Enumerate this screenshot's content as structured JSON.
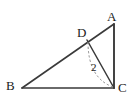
{
  "figure": {
    "background_color": "#ffffff",
    "stroke_color": "#3a3a3a",
    "dashed_stroke_color": "#8a8a8a",
    "text_color": "#1a1a1a",
    "width": 136,
    "height": 104
  },
  "points": {
    "A": {
      "label": "A",
      "x": 114,
      "y": 24,
      "label_x": 107,
      "label_y": 10
    },
    "B": {
      "label": "B",
      "x": 22,
      "y": 88,
      "label_x": 6,
      "label_y": 79
    },
    "C": {
      "label": "C",
      "x": 114,
      "y": 88,
      "label_x": 118,
      "label_y": 81
    },
    "D": {
      "label": "D",
      "x": 87,
      "y": 40,
      "label_x": 77,
      "label_y": 26
    }
  },
  "segments": [
    {
      "name": "segment-BA",
      "from": "B",
      "to": "A",
      "style": "solid"
    },
    {
      "name": "segment-BC",
      "from": "B",
      "to": "C",
      "style": "solid"
    },
    {
      "name": "segment-AC",
      "from": "A",
      "to": "C",
      "style": "solid"
    },
    {
      "name": "segment-DC",
      "from": "D",
      "to": "C",
      "style": "solid"
    }
  ],
  "arc": {
    "name": "arc-D-to-C",
    "style": "dashed",
    "start_x": 88,
    "start_y": 42,
    "end_x": 113,
    "end_y": 87,
    "control_x": 88,
    "control_y": 78,
    "measure_label": "2",
    "measure_label_x": 91,
    "measure_label_y": 62
  }
}
